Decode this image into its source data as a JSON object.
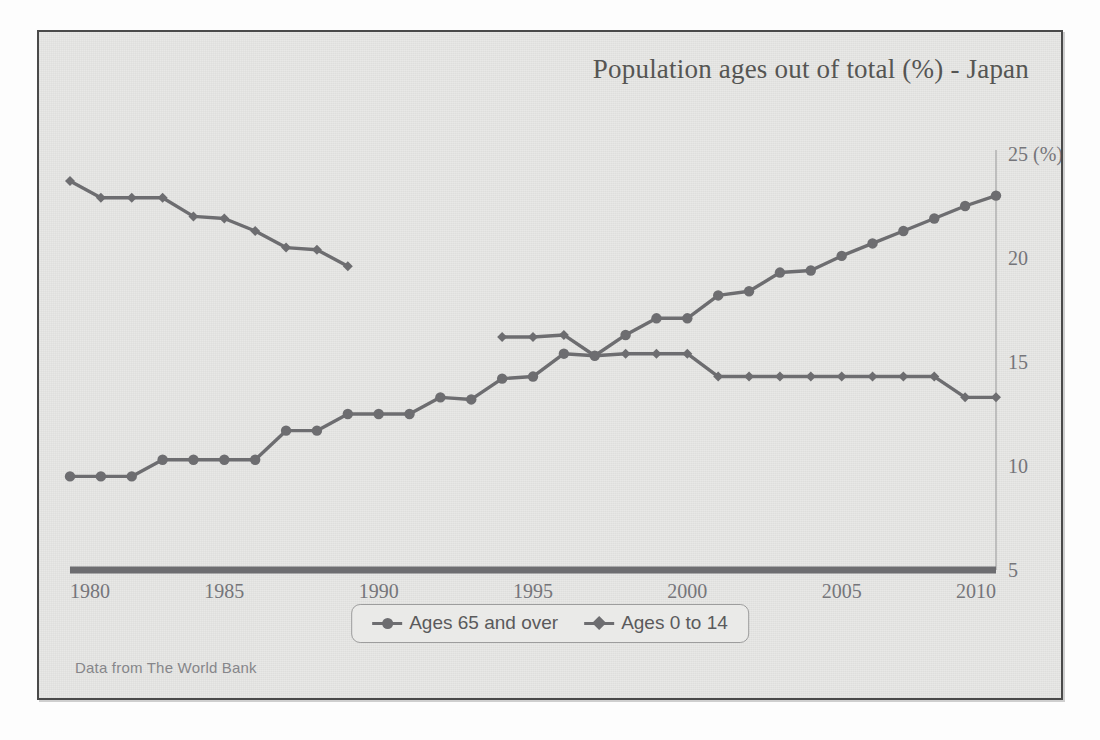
{
  "figure": {
    "title": "Population ages out of total (%) - Japan",
    "source_note": "Data from The World Bank",
    "y_axis_unit_label": "(%)",
    "colors": {
      "line": "#6d6d70",
      "axis": "#6d6d70",
      "text": "#75757a",
      "background": "#e8e8e6",
      "frame": "#4a4a4a"
    }
  },
  "legend": {
    "position": "bottom-center",
    "entries": [
      {
        "label": "Ages 65 and over",
        "marker": "circle"
      },
      {
        "label": "Ages 0 to 14",
        "marker": "diamond"
      }
    ]
  },
  "chart_data": {
    "type": "line",
    "title": "Population ages out of total (%) - Japan",
    "xlabel": "",
    "ylabel": "(%)",
    "xlim": [
      1980,
      2010
    ],
    "ylim": [
      5,
      25
    ],
    "xticks": [
      1980,
      1985,
      1990,
      1995,
      2000,
      2005,
      2010
    ],
    "yticks": [
      5,
      10,
      15,
      20,
      25
    ],
    "ytick_labels": [
      "5",
      "10",
      "15",
      "20",
      "25 (%)"
    ],
    "grid": false,
    "legend_position": "bottom-center",
    "annotations": [
      "Data from The World Bank"
    ],
    "series": [
      {
        "name": "Ages 65 and over",
        "marker": "circle",
        "x": [
          1980,
          1981,
          1982,
          1983,
          1984,
          1985,
          1986,
          1987,
          1988,
          1989,
          1990,
          1991,
          1992,
          1993,
          1994,
          1995,
          1996,
          1997,
          1998,
          1999,
          2000,
          2001,
          2002,
          2003,
          2004,
          2005,
          2006,
          2007,
          2008,
          2009,
          2010
        ],
        "values": [
          9.5,
          9.5,
          9.5,
          10.3,
          10.3,
          10.3,
          10.3,
          11.7,
          11.7,
          12.5,
          12.5,
          12.5,
          13.3,
          13.2,
          14.2,
          14.3,
          15.4,
          15.3,
          16.3,
          17.1,
          17.1,
          18.2,
          18.4,
          19.3,
          19.4,
          20.1,
          20.7,
          21.3,
          21.9,
          22.5,
          23.0
        ]
      },
      {
        "name": "Ages 0 to 14",
        "marker": "diamond",
        "x": [
          1980,
          1981,
          1982,
          1983,
          1984,
          1985,
          1986,
          1987,
          1988,
          1989,
          1994,
          1995,
          1996,
          1997,
          1998,
          1999,
          2000,
          2001,
          2002,
          2003,
          2004,
          2005,
          2006,
          2007,
          2008,
          2009,
          2010
        ],
        "values": [
          23.7,
          22.9,
          22.9,
          22.9,
          22.0,
          21.9,
          21.3,
          20.5,
          20.4,
          19.6,
          16.2,
          16.2,
          16.3,
          15.3,
          15.4,
          15.4,
          15.4,
          14.3,
          14.3,
          14.3,
          14.3,
          14.3,
          14.3,
          14.3,
          14.3,
          13.3,
          13.3
        ]
      }
    ]
  }
}
